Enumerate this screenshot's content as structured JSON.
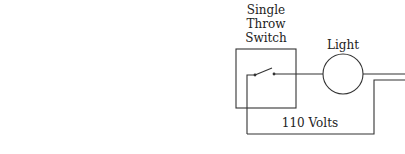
{
  "diagram": {
    "switch_label_lines": [
      "Single",
      "Throw",
      "Switch"
    ],
    "light_label": "Light",
    "voltage_label": "110 Volts",
    "colors": {
      "line": "#333333",
      "text": "#222222",
      "background": "#ffffff"
    }
  }
}
